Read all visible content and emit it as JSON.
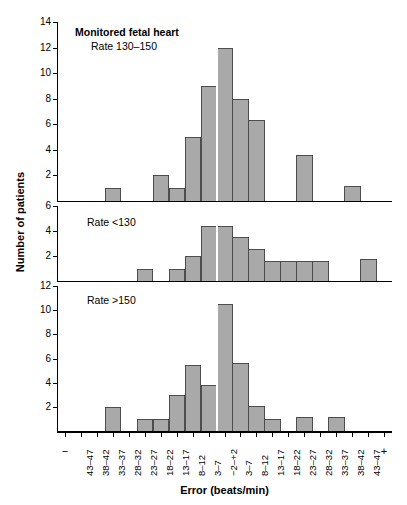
{
  "figure": {
    "y_axis_title": "Number of patients",
    "x_axis_title": "Error (beats/min)",
    "bar_color": "#a9a9a9",
    "bar_edge_color": "#4d4d4d",
    "background": "#ffffff"
  },
  "chart_data": {
    "type": "bar",
    "title": "Monitored fetal heart",
    "xlabel": "Error (beats/min)",
    "ylabel": "Number of patients",
    "grid": false,
    "legend": "none",
    "categories": [
      "−",
      "43–47",
      "38–42",
      "33–37",
      "28–32",
      "23–27",
      "18–22",
      "13–17",
      "8–12",
      "3–7",
      "−2–+2",
      "3–7",
      "8–12",
      "13–17",
      "18–22",
      "23–27",
      "28–32",
      "33–37",
      "38–42",
      "43–47",
      "+"
    ],
    "panels": [
      {
        "label": "Monitored fetal heart",
        "sublabel": "Rate 130–150",
        "label_bold": true,
        "ylim": [
          0,
          14
        ],
        "yticks": [
          2,
          4,
          6,
          8,
          10,
          12,
          14
        ],
        "values": [
          0,
          0,
          0,
          1,
          0,
          0,
          2,
          1,
          5,
          9,
          12,
          8,
          6.3,
          0,
          0,
          3.6,
          0,
          0,
          1.2,
          0,
          0
        ]
      },
      {
        "label": "Rate <130",
        "sublabel": "",
        "label_bold": false,
        "ylim": [
          0,
          6
        ],
        "yticks": [
          2,
          4,
          6
        ],
        "values": [
          0,
          0,
          0,
          0,
          0,
          1,
          0,
          1,
          2,
          4.4,
          4.4,
          3.5,
          2.6,
          1.6,
          1.6,
          1.6,
          1.6,
          0,
          0,
          1.8,
          0
        ]
      },
      {
        "label": "Rate >150",
        "sublabel": "",
        "label_bold": false,
        "ylim": [
          0,
          12
        ],
        "yticks": [
          2,
          4,
          6,
          8,
          10,
          12
        ],
        "values": [
          0,
          0,
          0,
          2,
          0,
          1,
          1,
          3,
          5.5,
          3.8,
          10.5,
          5.6,
          2.1,
          1,
          0,
          1.2,
          0,
          1.2,
          0,
          0,
          0
        ]
      }
    ]
  }
}
